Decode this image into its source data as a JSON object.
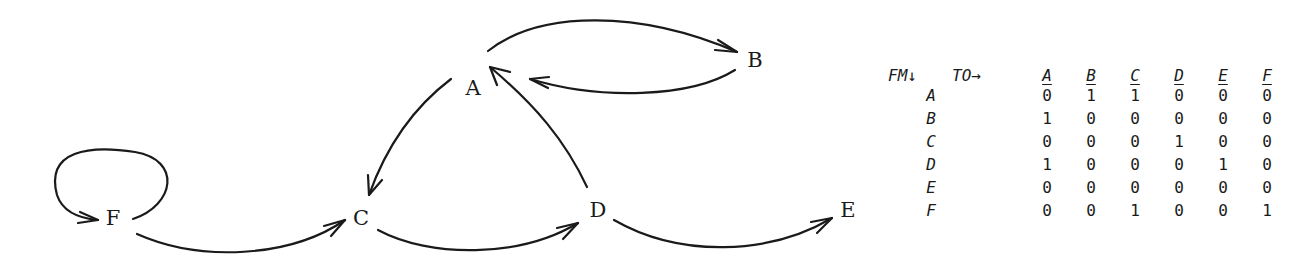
{
  "graph": {
    "nodes": [
      {
        "id": "A",
        "label": "A",
        "x": 473,
        "y": 88
      },
      {
        "id": "B",
        "label": "B",
        "x": 755,
        "y": 60
      },
      {
        "id": "C",
        "label": "C",
        "x": 361,
        "y": 218
      },
      {
        "id": "D",
        "label": "D",
        "x": 598,
        "y": 210
      },
      {
        "id": "E",
        "label": "E",
        "x": 848,
        "y": 210
      },
      {
        "id": "F",
        "label": "F",
        "x": 113,
        "y": 218
      }
    ],
    "edges": [
      {
        "from": "A",
        "to": "B"
      },
      {
        "from": "B",
        "to": "A"
      },
      {
        "from": "A",
        "to": "C"
      },
      {
        "from": "D",
        "to": "A"
      },
      {
        "from": "C",
        "to": "D"
      },
      {
        "from": "D",
        "to": "E"
      },
      {
        "from": "F",
        "to": "C"
      },
      {
        "from": "F",
        "to": "F"
      }
    ]
  },
  "matrix": {
    "from_label": "FM↓",
    "to_label": "TO→",
    "columns": [
      "A",
      "B",
      "C",
      "D",
      "E",
      "F"
    ],
    "rows": [
      {
        "label": "A",
        "values": [
          "0",
          "1",
          "1",
          "0",
          "0",
          "0"
        ]
      },
      {
        "label": "B",
        "values": [
          "1",
          "0",
          "0",
          "0",
          "0",
          "0"
        ]
      },
      {
        "label": "C",
        "values": [
          "0",
          "0",
          "0",
          "1",
          "0",
          "0"
        ]
      },
      {
        "label": "D",
        "values": [
          "1",
          "0",
          "0",
          "0",
          "1",
          "0"
        ]
      },
      {
        "label": "E",
        "values": [
          "0",
          "0",
          "0",
          "0",
          "0",
          "0"
        ]
      },
      {
        "label": "F",
        "values": [
          "0",
          "0",
          "1",
          "0",
          "0",
          "1"
        ]
      }
    ]
  }
}
